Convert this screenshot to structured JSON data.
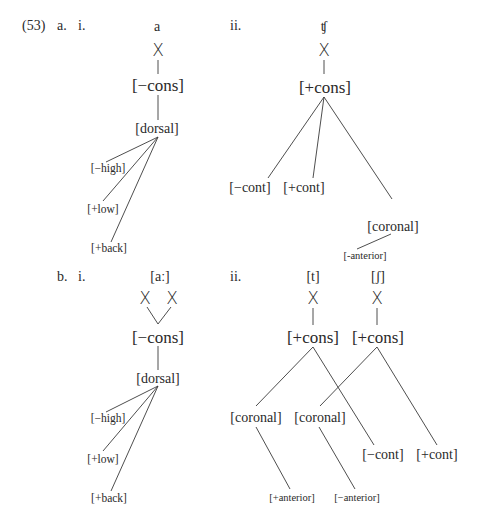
{
  "example": {
    "number": "(53)",
    "a": {
      "label": "a.",
      "i": {
        "label": "i.",
        "segment": "a",
        "timing": "X",
        "root": "[−cons]",
        "place": "[dorsal]",
        "features": [
          "[−high]",
          "[+low]",
          "[+back]"
        ]
      },
      "ii": {
        "label": "ii.",
        "segment": "ʧ",
        "timing": "X",
        "root": "[+cons]",
        "manner": [
          "[−cont]",
          "[+cont]"
        ],
        "place": "[coronal]",
        "place_feature": "[-anterior]"
      }
    },
    "b": {
      "label": "b.",
      "i": {
        "label": "i.",
        "segment": "[aː]",
        "timing": [
          "X",
          "X"
        ],
        "root": "[−cons]",
        "place": "[dorsal]",
        "features": [
          "[−high]",
          "[+low]",
          "[+back]"
        ]
      },
      "ii": {
        "label": "ii.",
        "segments": [
          "[t]",
          "[ʃ]"
        ],
        "timing": [
          "X",
          "X"
        ],
        "roots": [
          "[+cons]",
          "[+cons]"
        ],
        "places": [
          "[coronal]",
          "[coronal]"
        ],
        "manner": [
          "[−cont]",
          "[+cont]"
        ],
        "place_features": [
          "[+anterior]",
          "[−anterior]"
        ]
      }
    }
  }
}
